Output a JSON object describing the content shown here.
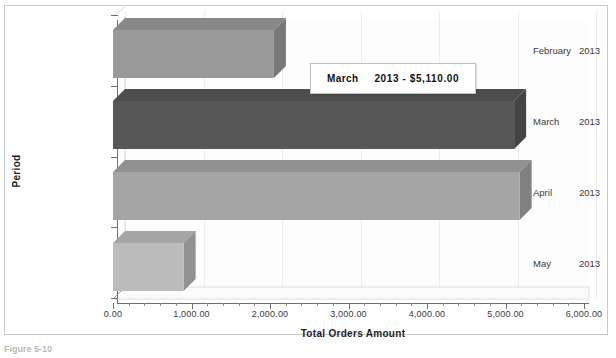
{
  "chart_data": {
    "type": "bar",
    "orientation": "horizontal",
    "title": "",
    "xlabel": "Total Orders Amount",
    "ylabel": "Period",
    "categories": [
      "February  2013",
      "March    2013",
      "April   2013",
      "May    2013"
    ],
    "values": [
      2050,
      5110,
      5180,
      900
    ],
    "xlim": [
      0,
      6000
    ],
    "xticks": [
      0,
      1000,
      2000,
      3000,
      4000,
      5000,
      6000
    ],
    "xticklabels": [
      "0.00",
      "1,000.00",
      "2,000.00",
      "3,000.00",
      "4,000.00",
      "5,000.00",
      "6,000.00"
    ],
    "grid": true,
    "legend": false,
    "series": [
      {
        "name": "Total Orders Amount",
        "points": [
          {
            "label": "February  2013",
            "month": "February",
            "year": "2013",
            "value": 2050,
            "color": "#9a9a9a"
          },
          {
            "label": "March    2013",
            "month": "March",
            "year": "2013",
            "value": 5110,
            "color": "#575757"
          },
          {
            "label": "April   2013",
            "month": "April",
            "year": "2013",
            "value": 5180,
            "color": "#a5a5a5"
          },
          {
            "label": "May    2013",
            "month": "May",
            "year": "2013",
            "value": 900,
            "color": "#bbbbbb"
          }
        ]
      }
    ],
    "annotations": [
      {
        "type": "tooltip",
        "month": "March",
        "text": "2013 - $5,110.00",
        "target": "March    2013"
      }
    ]
  },
  "axis": {
    "x_title": "Total Orders Amount",
    "y_title": "Period",
    "x_labels": [
      "0.00",
      "1,000.00",
      "2,000.00",
      "3,000.00",
      "4,000.00",
      "5,000.00",
      "6,000.00"
    ],
    "y_labels": [
      {
        "month": "February",
        "year": "2013"
      },
      {
        "month": "March",
        "year": "2013"
      },
      {
        "month": "April",
        "year": "2013"
      },
      {
        "month": "May",
        "year": "2013"
      }
    ]
  },
  "tooltip": {
    "month": "March",
    "value": "2013 - $5,110.00"
  },
  "caption": {
    "text": "Figure 5-10"
  },
  "colors": {
    "frame_border": "#c9c9c9",
    "axis": "#6e6e6e",
    "grid": "#e8e8e8",
    "bar_feb": "#9a9a9a",
    "bar_mar": "#575757",
    "bar_apr": "#a5a5a5",
    "bar_may": "#bbbbbb"
  }
}
